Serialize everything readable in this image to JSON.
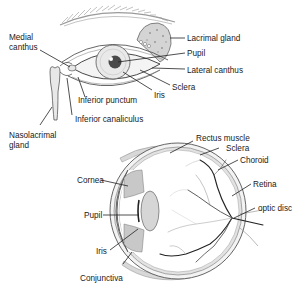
{
  "external_eye": {
    "labels": {
      "medial_canthus_1": "Medial",
      "medial_canthus_2": "canthus",
      "lacrimal_gland": "Lacrimal gland",
      "pupil": "Pupil",
      "lateral_canthus": "Lateral canthus",
      "sclera": "Sclera",
      "iris": "Iris",
      "inferior_punctum": "Inferior punctum",
      "inferior_canaliculus": "Inferior canaliculus",
      "nasolacrimal_1": "Nasolacrimal",
      "nasolacrimal_2": "gland"
    }
  },
  "cross_section": {
    "labels": {
      "rectus_muscle": "Rectus muscle",
      "sclera": "Sclera",
      "choroid": "Choroid",
      "retina": "Retina",
      "optic_disc": "optic disc",
      "cornea": "Cornea",
      "pupil": "Pupil",
      "iris": "Iris",
      "conjunctiva": "Conjunctiva"
    }
  }
}
